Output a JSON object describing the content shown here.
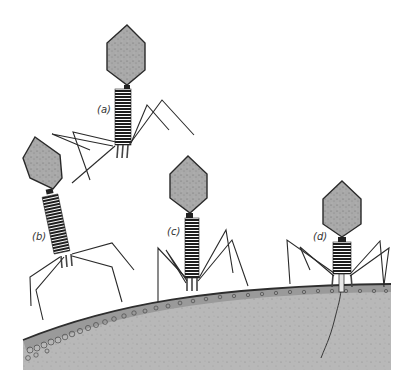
{
  "diagram": {
    "colors": {
      "background": "#ffffff",
      "head_fill": "#a8a8a8",
      "head_stroke": "#2a2a2a",
      "tail": "#222222",
      "legs": "#2a2a2a",
      "cell_fill": "#b9b9b9",
      "cell_wall": "#8f8f8f",
      "cell_edge": "#333333"
    },
    "labels": {
      "a": "(a)",
      "b": "(b)",
      "c": "(c)",
      "d": "(d)"
    },
    "phages": [
      {
        "id": "a",
        "state": "free, approaching",
        "label": "(a)"
      },
      {
        "id": "b",
        "state": "tail fibers touching cell",
        "label": "(b)"
      },
      {
        "id": "c",
        "state": "attached to cell surface",
        "label": "(c)"
      },
      {
        "id": "d",
        "state": "tail sheath contracted, injecting DNA",
        "label": "(d)"
      }
    ],
    "cell": {
      "name": "bacterial-cell-surface"
    }
  }
}
